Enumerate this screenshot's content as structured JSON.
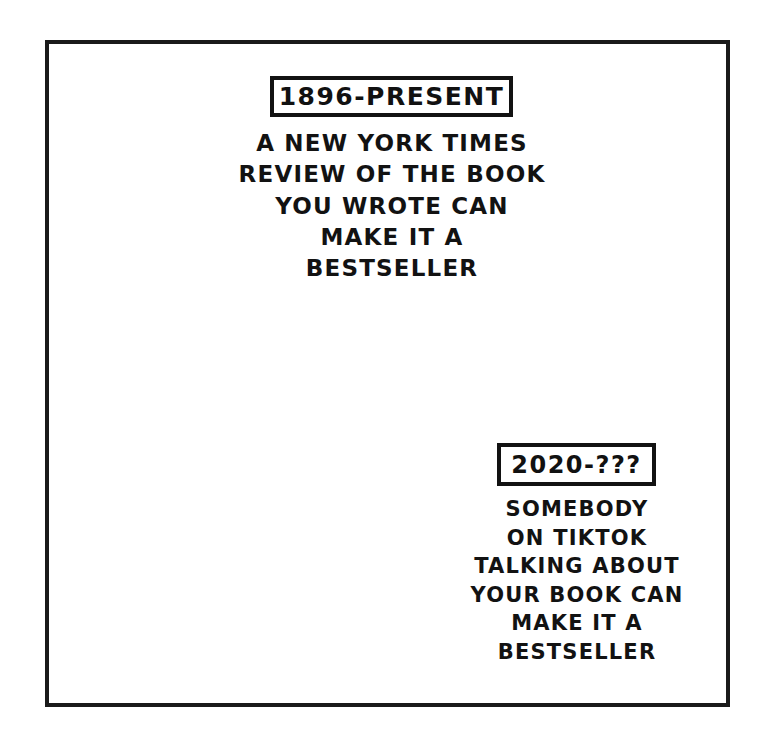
{
  "comic": {
    "panel_name": "xkcd-style timeline comic panel",
    "background_color": "#ffffff",
    "ink_color": "#121212"
  },
  "annotations": {
    "top": {
      "date_label": "1896-PRESENT",
      "caption_lines": [
        "A NEW YORK TIMES",
        "REVIEW OF THE BOOK",
        "YOU WROTE CAN",
        "MAKE IT A",
        "BESTSELLER"
      ]
    },
    "bottom": {
      "date_label": "2020-???",
      "caption_lines": [
        "SOMEBODY",
        "ON TIKTOK",
        "TALKING ABOUT",
        "YOUR BOOK CAN",
        "MAKE IT A",
        "BESTSELLER"
      ]
    }
  },
  "timeline": {
    "start_marker": "filled-dot",
    "end_marker": "arrowhead",
    "direction": "left-to-right",
    "upper_bracket_label_ref": "1896-PRESENT",
    "lower_bracket_label_ref": "2020-???"
  }
}
